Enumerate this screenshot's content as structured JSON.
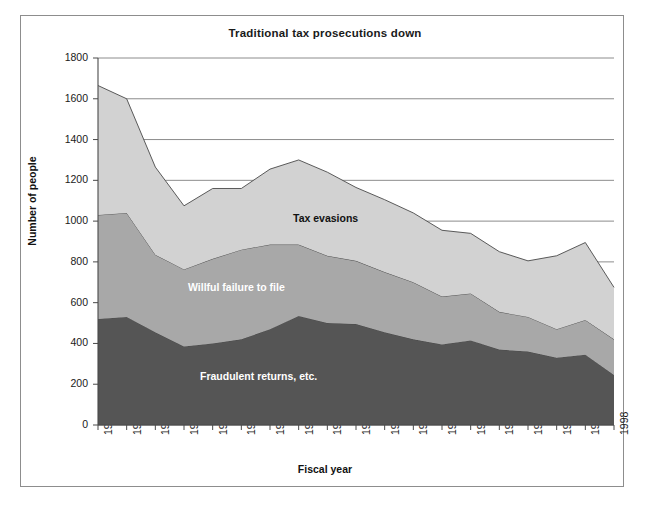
{
  "chart_data": {
    "type": "area",
    "stacked": true,
    "title": "Traditional tax prosecutions down",
    "xlabel": "Fiscal year",
    "ylabel": "Number of people",
    "ylim": [
      0,
      1800
    ],
    "ytick_step": 200,
    "yticks": [
      "1800",
      "1600",
      "1400",
      "1200",
      "1000",
      "800",
      "600",
      "400",
      "200",
      "0"
    ],
    "grid": "horizontal",
    "legend": "inline-labels",
    "categories": [
      "1980",
      "1981",
      "1982",
      "1983",
      "1984",
      "1985",
      "1986",
      "1987",
      "1988",
      "1989",
      "1990",
      "1991",
      "1992",
      "1993",
      "1994",
      "1995",
      "1996",
      "1997",
      "1998"
    ],
    "series": [
      {
        "name": "Tax evasions",
        "color": "#555555",
        "values": [
          520,
          530,
          455,
          385,
          400,
          420,
          470,
          535,
          500,
          495,
          455,
          420,
          395,
          415,
          370,
          360,
          330,
          345,
          245
        ]
      },
      {
        "name": "Willful failure to file",
        "color": "#a8a8a8",
        "values": [
          510,
          510,
          380,
          378,
          415,
          440,
          415,
          350,
          330,
          310,
          295,
          280,
          235,
          230,
          185,
          170,
          140,
          170,
          175
        ]
      },
      {
        "name": "Fraudulent returns, etc.",
        "color": "#d2d2d2",
        "values": [
          635,
          560,
          430,
          312,
          345,
          300,
          370,
          415,
          410,
          360,
          355,
          340,
          325,
          295,
          295,
          275,
          360,
          380,
          255
        ]
      }
    ],
    "totals": [
      1665,
      1600,
      1265,
      1075,
      1160,
      1160,
      1255,
      1300,
      1240,
      1165,
      1105,
      1040,
      955,
      940,
      850,
      805,
      830,
      895,
      675
    ]
  }
}
